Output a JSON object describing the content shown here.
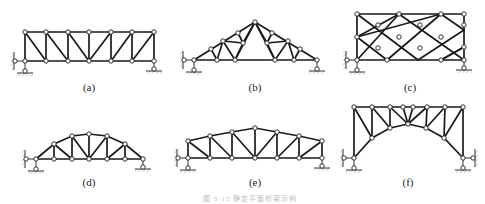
{
  "figure": {
    "caption": "图 3-15 静定平面桁架示例",
    "panels": [
      {
        "id": "a",
        "label": "(a)",
        "type": "parallel-chord truss"
      },
      {
        "id": "b",
        "label": "(b)",
        "type": "triangular (Fink) roof truss"
      },
      {
        "id": "c",
        "label": "(c)",
        "type": "lattice rectangular truss"
      },
      {
        "id": "d",
        "label": "(d)",
        "type": "curved top-chord truss"
      },
      {
        "id": "e",
        "label": "(e)",
        "type": "trapezoidal / polygonal truss"
      },
      {
        "id": "f",
        "label": "(f)",
        "type": "arch truss"
      }
    ]
  }
}
